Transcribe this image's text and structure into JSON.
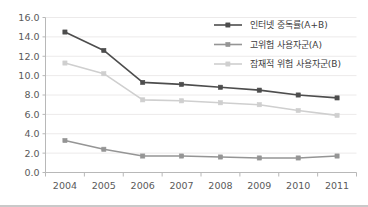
{
  "chart_data": {
    "type": "line",
    "title": "",
    "xlabel": "",
    "ylabel": "",
    "x": [
      "2004",
      "2005",
      "2006",
      "2007",
      "2008",
      "2009",
      "2010",
      "2011"
    ],
    "categories": [
      "2004",
      "2005",
      "2006",
      "2007",
      "2008",
      "2009",
      "2010",
      "2011"
    ],
    "series": [
      {
        "name": "인터넷 중독률(A+B)",
        "color": "#4d4d4d",
        "marker": "square",
        "values": [
          14.5,
          12.6,
          9.3,
          9.1,
          8.8,
          8.5,
          8.0,
          7.7
        ]
      },
      {
        "name": "고위험 사용자군(A)",
        "color": "#959595",
        "marker": "square",
        "values": [
          3.3,
          2.4,
          1.7,
          1.7,
          1.6,
          1.5,
          1.5,
          1.7
        ]
      },
      {
        "name": "잠재적 위험 사용자군(B)",
        "color": "#cfcfcf",
        "marker": "square",
        "values": [
          11.3,
          10.2,
          7.5,
          7.4,
          7.2,
          7.0,
          6.4,
          5.9
        ]
      }
    ],
    "ylim": [
      0,
      16
    ],
    "yticks": [
      "0.0",
      "2.0",
      "4.0",
      "6.0",
      "8.0",
      "10.0",
      "12.0",
      "14.0",
      "16.0"
    ],
    "ytick_values": [
      0,
      2,
      4,
      6,
      8,
      10,
      12,
      14,
      16
    ],
    "grid": true,
    "grid_axis": "y",
    "legend_position": "top-right",
    "legend": [
      "인터넷 중독률(A+B)",
      "고위험 사용자군(A)",
      "잠재적 위험 사용자군(B)"
    ]
  },
  "colors": {
    "series_total": "#4d4d4d",
    "series_high_risk": "#959595",
    "series_potential_risk": "#cfcfcf",
    "gridline": "#eceaea",
    "axis": "#b8b8b8",
    "text": "#5a5a5a",
    "background": "#ffffff"
  }
}
